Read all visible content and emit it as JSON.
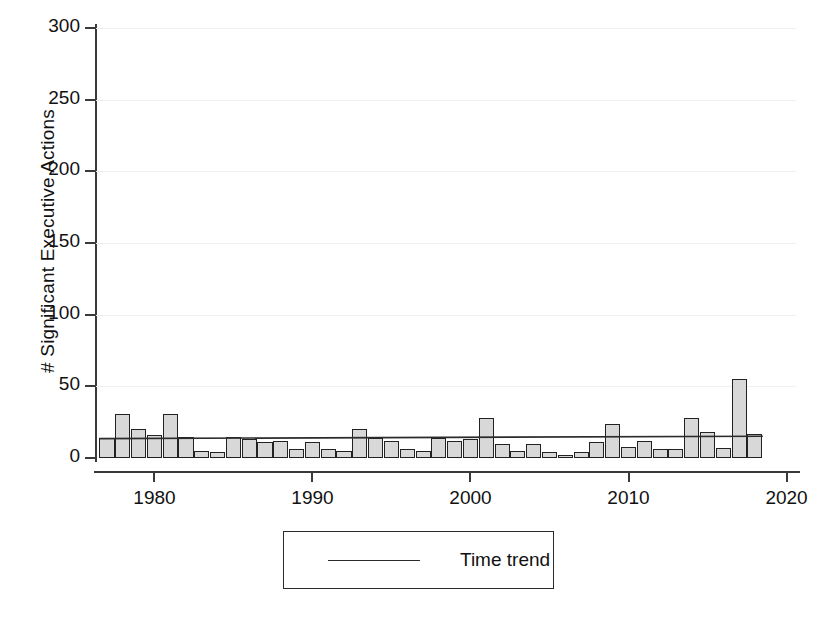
{
  "chart_data": {
    "type": "bar",
    "title": "",
    "subtitle": "",
    "xlabel": "",
    "ylabel": "# Significant Executive Actions",
    "xlim": [
      1976.3,
      2020.6
    ],
    "ylim": [
      0,
      300
    ],
    "grid": true,
    "y_ticks": [
      0,
      50,
      100,
      150,
      200,
      250,
      300
    ],
    "y_tick_labels": [
      "0",
      "50",
      "100",
      "150",
      "200",
      "250",
      "300"
    ],
    "x_ticks": [
      1980,
      1990,
      2000,
      2010,
      2020
    ],
    "x_tick_labels": [
      "1980",
      "1990",
      "2000",
      "2010",
      "2020"
    ],
    "legend": {
      "position": "below-plot",
      "entries": [
        {
          "label": "Time trend",
          "marker": "line",
          "color": "#2b2b2b"
        }
      ]
    },
    "bar_style": {
      "fill": "#d8d8d8",
      "edge": "#222222"
    },
    "categories": [
      1977,
      1978,
      1979,
      1980,
      1981,
      1982,
      1983,
      1984,
      1985,
      1986,
      1987,
      1988,
      1989,
      1990,
      1991,
      1992,
      1993,
      1994,
      1995,
      1996,
      1997,
      1998,
      1999,
      2000,
      2001,
      2002,
      2003,
      2004,
      2005,
      2006,
      2007,
      2008,
      2009,
      2010,
      2011,
      2012,
      2013,
      2014,
      2015,
      2016,
      2017,
      2018
    ],
    "values": [
      14,
      31,
      20,
      16,
      31,
      15,
      5,
      4,
      15,
      13,
      11,
      12,
      6,
      11,
      6,
      5,
      20,
      14,
      12,
      6,
      5,
      14,
      12,
      13,
      28,
      10,
      5,
      10,
      4,
      2,
      4,
      11,
      24,
      8,
      12,
      6,
      6,
      28,
      18,
      7,
      55,
      17
    ],
    "series": [
      {
        "name": "Time trend",
        "type": "line",
        "color": "#2b2b2b",
        "x": [
          1977,
          2018
        ],
        "values": [
          13.5,
          15.2
        ]
      }
    ]
  }
}
